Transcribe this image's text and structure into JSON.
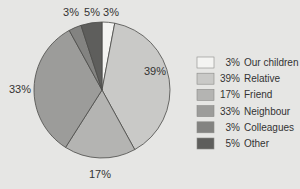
{
  "chart_data": {
    "type": "pie",
    "title": "",
    "start_angle": "12 o'clock",
    "direction": "clockwise",
    "categories": [
      "Our children",
      "Relative",
      "Friend",
      "Neighbour",
      "Colleagues",
      "Other"
    ],
    "values": [
      3,
      39,
      17,
      33,
      3,
      5
    ],
    "unit": "%",
    "colors": [
      "#f4f4f2",
      "#c9c9c7",
      "#b4b4b2",
      "#9c9c9a",
      "#838381",
      "#5e5e5c"
    ],
    "data_labels": [
      "3%",
      "39%",
      "17%",
      "33%",
      "3%",
      "5%"
    ],
    "legend": {
      "position": "right",
      "entries": [
        {
          "value": "3%",
          "label": "Our children"
        },
        {
          "value": "39%",
          "label": "Relative"
        },
        {
          "value": "17%",
          "label": "Friend"
        },
        {
          "value": "33%",
          "label": "Neighbour"
        },
        {
          "value": "3%",
          "label": "Colleagues"
        },
        {
          "value": "5%",
          "label": "Other"
        }
      ]
    }
  }
}
